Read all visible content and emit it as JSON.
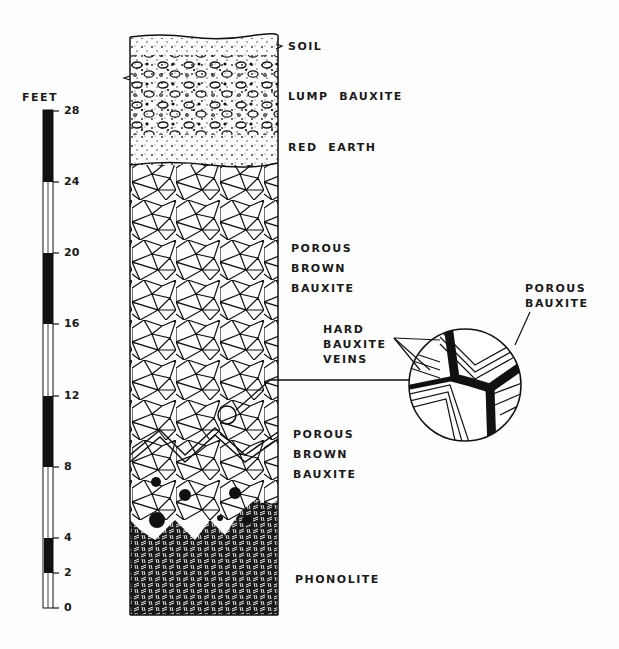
{
  "scale": {
    "unit_label": "FEET",
    "ticks": [
      {
        "value": "28",
        "y": 111
      },
      {
        "value": "24",
        "y": 182
      },
      {
        "value": "20",
        "y": 253
      },
      {
        "value": "16",
        "y": 324
      },
      {
        "value": "12",
        "y": 396
      },
      {
        "value": "8",
        "y": 467
      },
      {
        "value": "4",
        "y": 538
      },
      {
        "value": "2",
        "y": 573
      },
      {
        "value": "0",
        "y": 608
      }
    ]
  },
  "layers": {
    "soil": "SOIL",
    "lump_bauxite": "LUMP  BAUXITE",
    "red_earth": "RED  EARTH",
    "porous_brown_upper": [
      "POROUS",
      "BROWN",
      "BAUXITE"
    ],
    "porous_brown_lower": [
      "POROUS",
      "BROWN",
      "BAUXITE"
    ],
    "phonolite": "PHONOLITE"
  },
  "inset": {
    "veins_label": [
      "HARD",
      "BAUXITE",
      "VEINS"
    ],
    "porous_label": [
      "POROUS",
      "BAUXITE"
    ]
  },
  "colors": {
    "ink": "#111111",
    "paper": "#fefefe"
  }
}
